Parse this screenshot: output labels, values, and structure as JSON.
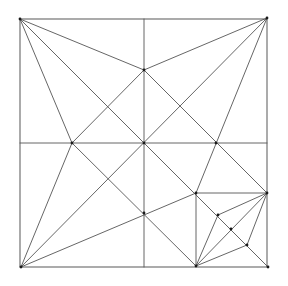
{
  "diagram": {
    "type": "origami-crease-pattern",
    "colors": {
      "line": "#555555",
      "edge": "#666666",
      "node": "#1a1a1a",
      "background": "#ffffff"
    },
    "square": {
      "x1": 20,
      "y1": 19,
      "x2": 267,
      "y2": 267
    },
    "points": {
      "TL": [
        20,
        19
      ],
      "TR": [
        267,
        18
      ],
      "BL": [
        21,
        267
      ],
      "BR": [
        268,
        267
      ],
      "C": [
        144,
        143
      ],
      "T": [
        144,
        70
      ],
      "L": [
        72,
        143
      ],
      "B": [
        144,
        213
      ],
      "R": [
        216,
        143
      ],
      "P": [
        196,
        193
      ],
      "E": [
        267,
        193
      ],
      "F": [
        196,
        266
      ],
      "Q": [
        218,
        215
      ],
      "M": [
        231,
        229
      ],
      "S": [
        247,
        245
      ],
      "TM": [
        144,
        19
      ],
      "LM": [
        20,
        143
      ],
      "RM": [
        267,
        143
      ],
      "BM": [
        144,
        267
      ]
    },
    "lines": [
      [
        "TM",
        "BM"
      ],
      [
        "LM",
        "RM"
      ],
      [
        "TL",
        "BR"
      ],
      [
        "BL",
        "TR"
      ],
      [
        "TL",
        "T"
      ],
      [
        "TL",
        "L"
      ],
      [
        "TR",
        "T"
      ],
      [
        "TR",
        "P"
      ],
      [
        "BL",
        "L"
      ],
      [
        "BL",
        "P"
      ],
      [
        "T",
        "L"
      ],
      [
        "T",
        "E"
      ],
      [
        "L",
        "F"
      ],
      [
        "P",
        "E"
      ],
      [
        "P",
        "F"
      ],
      [
        "E",
        "F"
      ],
      [
        "E",
        "Q"
      ],
      [
        "Q",
        "F"
      ],
      [
        "E",
        "S"
      ],
      [
        "S",
        "F"
      ]
    ],
    "nodes": [
      "TL",
      "TR",
      "BL",
      "BR",
      "C",
      "T",
      "L",
      "B",
      "R",
      "P",
      "E",
      "F",
      "Q",
      "M",
      "S"
    ]
  }
}
